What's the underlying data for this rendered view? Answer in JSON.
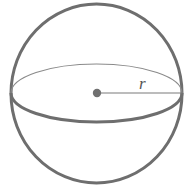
{
  "diagram": {
    "radius_label": "r",
    "colors": {
      "stroke": "#6e6e6e",
      "back_stroke": "#8a8a8a",
      "center_dot": "#707070",
      "background": "#ffffff"
    },
    "elements": [
      {
        "type": "sphere-outline",
        "description": "outer circle of sphere"
      },
      {
        "type": "equator-back-arc",
        "description": "thin back half of equator ellipse"
      },
      {
        "type": "equator-front-arc",
        "description": "thick front half of equator ellipse"
      },
      {
        "type": "center-point",
        "description": "center of sphere"
      },
      {
        "type": "radius-line",
        "description": "line from center to surface",
        "label": "r"
      }
    ]
  }
}
